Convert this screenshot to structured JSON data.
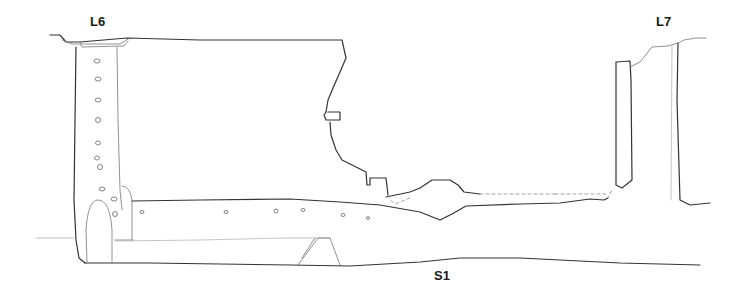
{
  "figure": {
    "type": "archaeological section drawing",
    "labels": {
      "l6": "L6",
      "l7": "L7",
      "s1": "S1"
    },
    "colors": {
      "line": "#333333",
      "thin_line": "#777777",
      "stipple": "#888888",
      "background": "#ffffff"
    }
  }
}
